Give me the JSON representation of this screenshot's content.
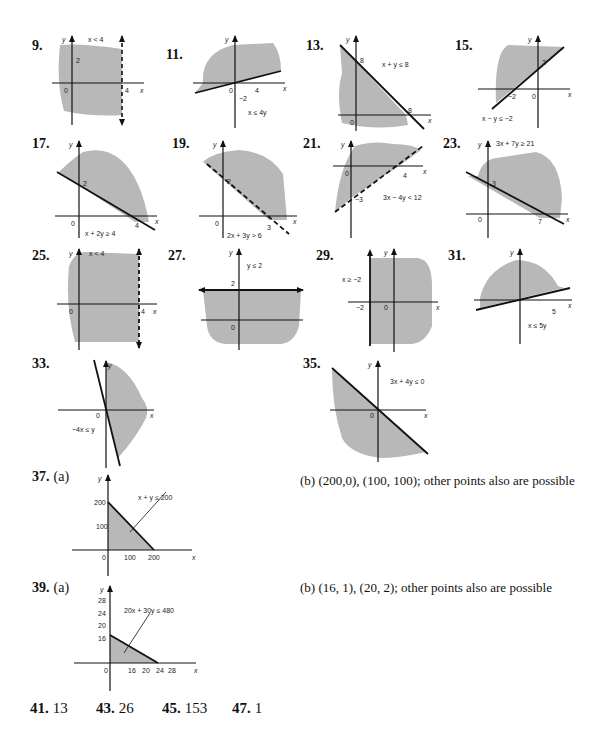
{
  "problems": {
    "p9": {
      "num": "9.",
      "ineq": "x < 4",
      "labels": [
        "2",
        "0",
        "4"
      ]
    },
    "p11": {
      "num": "11.",
      "ineq": "x ≤ 4y",
      "labels": [
        "0",
        "4",
        "−2"
      ]
    },
    "p13": {
      "num": "13.",
      "ineq": "x + y ≤ 8",
      "labels": [
        "8",
        "0",
        "8"
      ]
    },
    "p15": {
      "num": "15.",
      "ineq": "x − y ≤ −2",
      "labels": [
        "2",
        "−2",
        "0"
      ]
    },
    "p17": {
      "num": "17.",
      "ineq": "x + 2y ≥ 4",
      "labels": [
        "2",
        "0",
        "4"
      ]
    },
    "p19": {
      "num": "19.",
      "ineq": "2x + 3y > 6",
      "labels": [
        "2",
        "0",
        "3"
      ]
    },
    "p21": {
      "num": "21.",
      "ineq": "3x − 4y < 12",
      "labels": [
        "0",
        "4",
        "−3"
      ]
    },
    "p23": {
      "num": "23.",
      "ineq": "3x + 7y ≥ 21",
      "labels": [
        "3",
        "0",
        "7"
      ]
    },
    "p25": {
      "num": "25.",
      "ineq": "x < 4",
      "labels": [
        "0",
        "4"
      ]
    },
    "p27": {
      "num": "27.",
      "ineq": "y ≤ 2",
      "labels": [
        "2",
        "0"
      ]
    },
    "p29": {
      "num": "29.",
      "ineq": "x ≥ −2",
      "labels": [
        "−2",
        "0"
      ]
    },
    "p31": {
      "num": "31.",
      "ineq": "x ≤ 5y",
      "labels": [
        "5"
      ]
    },
    "p33": {
      "num": "33.",
      "ineq": "−4x ≤ y",
      "labels": [
        "0"
      ]
    },
    "p35": {
      "num": "35.",
      "ineq": "3x + 4y ≤ 0",
      "labels": [
        "0"
      ]
    },
    "p37": {
      "num": "37.",
      "part": "(a)",
      "ineq": "x + y ≤ 200",
      "labels": [
        "200",
        "100",
        "0",
        "100",
        "200"
      ],
      "answer_b": "(b) (200,0), (100, 100); other points also are possible"
    },
    "p39": {
      "num": "39.",
      "part": "(a)",
      "ineq": "20x + 30y ≤ 480",
      "labels": [
        "28",
        "24",
        "20",
        "16",
        "0",
        "16",
        "20",
        "24",
        "28"
      ],
      "answer_b": "(b) (16, 1), (20, 2); other points also are possible"
    }
  },
  "axis": {
    "x": "x",
    "y": "y"
  },
  "answers": [
    {
      "num": "41.",
      "value": "13"
    },
    {
      "num": "43.",
      "value": "26"
    },
    {
      "num": "45.",
      "value": "153"
    },
    {
      "num": "47.",
      "value": "1"
    }
  ],
  "colors": {
    "shade": "#b8b8b8",
    "ink": "#111111"
  }
}
